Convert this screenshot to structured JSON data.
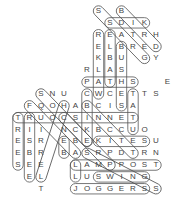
{
  "puzzle": {
    "type": "word-search",
    "origin": {
      "x": 18,
      "y": 11
    },
    "cell_w": 11.5,
    "cell_h": 11.85,
    "letters": [
      {
        "r": 0,
        "c": 7,
        "ch": "S"
      },
      {
        "r": 0,
        "c": 9,
        "ch": "B"
      },
      {
        "r": 1,
        "c": 8,
        "ch": "S"
      },
      {
        "r": 1,
        "c": 9,
        "ch": "D"
      },
      {
        "r": 1,
        "c": 10,
        "ch": "I"
      },
      {
        "r": 1,
        "c": 11,
        "ch": "K"
      },
      {
        "r": 2,
        "c": 7,
        "ch": "R"
      },
      {
        "r": 2,
        "c": 8,
        "ch": "E"
      },
      {
        "r": 2,
        "c": 9,
        "ch": "A"
      },
      {
        "r": 2,
        "c": 10,
        "ch": "T"
      },
      {
        "r": 2,
        "c": 11,
        "ch": "R"
      },
      {
        "r": 2,
        "c": 12,
        "ch": "H"
      },
      {
        "r": 3,
        "c": 7,
        "ch": "E"
      },
      {
        "r": 3,
        "c": 8,
        "ch": "L"
      },
      {
        "r": 3,
        "c": 9,
        "ch": "B"
      },
      {
        "r": 3,
        "c": 10,
        "ch": "R"
      },
      {
        "r": 3,
        "c": 11,
        "ch": "E"
      },
      {
        "r": 3,
        "c": 12,
        "ch": "D"
      },
      {
        "r": 4,
        "c": 7,
        "ch": "K"
      },
      {
        "r": 4,
        "c": 8,
        "ch": "B"
      },
      {
        "r": 4,
        "c": 9,
        "ch": "U"
      },
      {
        "r": 4,
        "c": 11,
        "ch": "G"
      },
      {
        "r": 4,
        "c": 12,
        "ch": "Y"
      },
      {
        "r": 5,
        "c": 6,
        "ch": "R"
      },
      {
        "r": 5,
        "c": 7,
        "ch": "L"
      },
      {
        "r": 5,
        "c": 8,
        "ch": "A"
      },
      {
        "r": 5,
        "c": 9,
        "ch": "S"
      },
      {
        "r": 6,
        "c": 6,
        "ch": "P"
      },
      {
        "r": 6,
        "c": 7,
        "ch": "A"
      },
      {
        "r": 6,
        "c": 8,
        "ch": "T"
      },
      {
        "r": 6,
        "c": 9,
        "ch": "H"
      },
      {
        "r": 6,
        "c": 10,
        "ch": "S"
      },
      {
        "r": 6,
        "c": 13,
        "ch": "E"
      },
      {
        "r": 7,
        "c": 2,
        "ch": "S"
      },
      {
        "r": 7,
        "c": 3,
        "ch": "N"
      },
      {
        "r": 7,
        "c": 4,
        "ch": "U"
      },
      {
        "r": 7,
        "c": 6,
        "ch": "C"
      },
      {
        "r": 7,
        "c": 7,
        "ch": "W"
      },
      {
        "r": 7,
        "c": 8,
        "ch": "C"
      },
      {
        "r": 7,
        "c": 9,
        "ch": "E"
      },
      {
        "r": 7,
        "c": 10,
        "ch": "T"
      },
      {
        "r": 7,
        "c": 11,
        "ch": "T"
      },
      {
        "r": 7,
        "c": 12,
        "ch": "S"
      },
      {
        "r": 8,
        "c": 1,
        "ch": "F"
      },
      {
        "r": 8,
        "c": 2,
        "ch": "Q"
      },
      {
        "r": 8,
        "c": 3,
        "ch": "O"
      },
      {
        "r": 8,
        "c": 4,
        "ch": "H"
      },
      {
        "r": 8,
        "c": 5,
        "ch": "A"
      },
      {
        "r": 8,
        "c": 6,
        "ch": "B"
      },
      {
        "r": 8,
        "c": 7,
        "ch": "C"
      },
      {
        "r": 8,
        "c": 8,
        "ch": "I"
      },
      {
        "r": 8,
        "c": 9,
        "ch": "S"
      },
      {
        "r": 8,
        "c": 10,
        "ch": "A"
      },
      {
        "r": 9,
        "c": 0,
        "ch": "T"
      },
      {
        "r": 9,
        "c": 1,
        "ch": "R"
      },
      {
        "r": 9,
        "c": 2,
        "ch": "U"
      },
      {
        "r": 9,
        "c": 3,
        "ch": "O"
      },
      {
        "r": 9,
        "c": 4,
        "ch": "C"
      },
      {
        "r": 9,
        "c": 5,
        "ch": "S"
      },
      {
        "r": 9,
        "c": 6,
        "ch": "I"
      },
      {
        "r": 9,
        "c": 7,
        "ch": "N"
      },
      {
        "r": 9,
        "c": 8,
        "ch": "N"
      },
      {
        "r": 9,
        "c": 9,
        "ch": "E"
      },
      {
        "r": 9,
        "c": 10,
        "ch": "T"
      },
      {
        "r": 10,
        "c": 0,
        "ch": "R"
      },
      {
        "r": 10,
        "c": 1,
        "ch": "I"
      },
      {
        "r": 10,
        "c": 2,
        "ch": "I"
      },
      {
        "r": 10,
        "c": 4,
        "ch": "N"
      },
      {
        "r": 10,
        "c": 5,
        "ch": "C"
      },
      {
        "r": 10,
        "c": 6,
        "ch": "K"
      },
      {
        "r": 10,
        "c": 7,
        "ch": "B"
      },
      {
        "r": 10,
        "c": 8,
        "ch": "C"
      },
      {
        "r": 10,
        "c": 9,
        "ch": "C"
      },
      {
        "r": 10,
        "c": 10,
        "ch": "U"
      },
      {
        "r": 10,
        "c": 11,
        "ch": "O"
      },
      {
        "r": 11,
        "c": 0,
        "ch": "E"
      },
      {
        "r": 11,
        "c": 1,
        "ch": "S"
      },
      {
        "r": 11,
        "c": 2,
        "ch": "R"
      },
      {
        "r": 11,
        "c": 4,
        "ch": "E"
      },
      {
        "r": 11,
        "c": 5,
        "ch": "B"
      },
      {
        "r": 11,
        "c": 6,
        "ch": "E"
      },
      {
        "r": 11,
        "c": 7,
        "ch": "K"
      },
      {
        "r": 11,
        "c": 8,
        "ch": "I"
      },
      {
        "r": 11,
        "c": 9,
        "ch": "T"
      },
      {
        "r": 11,
        "c": 10,
        "ch": "E"
      },
      {
        "r": 11,
        "c": 11,
        "ch": "S"
      },
      {
        "r": 11,
        "c": 12,
        "ch": "U"
      },
      {
        "r": 12,
        "c": 0,
        "ch": "E"
      },
      {
        "r": 12,
        "c": 1,
        "ch": "B"
      },
      {
        "r": 12,
        "c": 2,
        "ch": "R"
      },
      {
        "r": 12,
        "c": 4,
        "ch": "B"
      },
      {
        "r": 12,
        "c": 5,
        "ch": "A"
      },
      {
        "r": 12,
        "c": 6,
        "ch": "S"
      },
      {
        "r": 12,
        "c": 7,
        "ch": "R"
      },
      {
        "r": 12,
        "c": 8,
        "ch": "P"
      },
      {
        "r": 12,
        "c": 9,
        "ch": "D"
      },
      {
        "r": 12,
        "c": 10,
        "ch": "T"
      },
      {
        "r": 12,
        "c": 11,
        "ch": "R"
      },
      {
        "r": 12,
        "c": 12,
        "ch": "N"
      },
      {
        "r": 13,
        "c": 0,
        "ch": "S"
      },
      {
        "r": 13,
        "c": 1,
        "ch": "E"
      },
      {
        "r": 13,
        "c": 2,
        "ch": "E"
      },
      {
        "r": 13,
        "c": 5,
        "ch": "L"
      },
      {
        "r": 13,
        "c": 6,
        "ch": "A"
      },
      {
        "r": 13,
        "c": 7,
        "ch": "M"
      },
      {
        "r": 13,
        "c": 8,
        "ch": "P"
      },
      {
        "r": 13,
        "c": 9,
        "ch": "P"
      },
      {
        "r": 13,
        "c": 10,
        "ch": "O"
      },
      {
        "r": 13,
        "c": 11,
        "ch": "S"
      },
      {
        "r": 13,
        "c": 12,
        "ch": "T"
      },
      {
        "r": 14,
        "c": 1,
        "ch": "E"
      },
      {
        "r": 14,
        "c": 2,
        "ch": "L"
      },
      {
        "r": 14,
        "c": 5,
        "ch": "L"
      },
      {
        "r": 14,
        "c": 6,
        "ch": "U"
      },
      {
        "r": 14,
        "c": 7,
        "ch": "S"
      },
      {
        "r": 14,
        "c": 8,
        "ch": "W"
      },
      {
        "r": 14,
        "c": 9,
        "ch": "I"
      },
      {
        "r": 14,
        "c": 10,
        "ch": "N"
      },
      {
        "r": 14,
        "c": 11,
        "ch": "G"
      },
      {
        "r": 15,
        "c": 2,
        "ch": "T"
      },
      {
        "r": 15,
        "c": 5,
        "ch": "J"
      },
      {
        "r": 15,
        "c": 6,
        "ch": "O"
      },
      {
        "r": 15,
        "c": 7,
        "ch": "G"
      },
      {
        "r": 15,
        "c": 8,
        "ch": "G"
      },
      {
        "r": 15,
        "c": 9,
        "ch": "E"
      },
      {
        "r": 15,
        "c": 10,
        "ch": "R"
      },
      {
        "r": 15,
        "c": 11,
        "ch": "S"
      },
      {
        "r": 15,
        "c": 12,
        "ch": "S"
      }
    ],
    "found_words": [
      {
        "word": "KIDS",
        "from": [
          1,
          11
        ],
        "to": [
          1,
          8
        ]
      },
      {
        "word": "BIRD",
        "from": [
          0,
          9
        ],
        "to": [
          3,
          12
        ]
      },
      {
        "word": "GRASS",
        "from": [
          4,
          11
        ],
        "to": [
          0,
          7
        ]
      },
      {
        "word": "WALKER",
        "from": [
          7,
          7
        ],
        "to": [
          2,
          7
        ]
      },
      {
        "word": "TABLE",
        "from": [
          6,
          8
        ],
        "to": [
          2,
          8
        ]
      },
      {
        "word": "BUSHES",
        "from": [
          3,
          9
        ],
        "to": [
          8,
          9
        ]
      },
      {
        "word": "PATHS",
        "from": [
          6,
          6
        ],
        "to": [
          6,
          10
        ]
      },
      {
        "word": "CYCLE",
        "from": [
          7,
          6
        ],
        "to": [
          11,
          6
        ]
      },
      {
        "word": "STEP",
        "from": [
          7,
          10
        ],
        "to": [
          10,
          10
        ]
      },
      {
        "word": "SHOES",
        "from": [
          7,
          2
        ],
        "to": [
          11,
          6
        ]
      },
      {
        "word": "FOOT",
        "from": [
          8,
          1
        ],
        "to": [
          12,
          5
        ]
      },
      {
        "word": "TOURIST",
        "from": [
          9,
          0
        ],
        "to": [
          9,
          10
        ]
      },
      {
        "word": "TREES",
        "from": [
          9,
          0
        ],
        "to": [
          13,
          0
        ]
      },
      {
        "word": "BIKES",
        "from": [
          9,
          1
        ],
        "to": [
          14,
          1
        ]
      },
      {
        "word": "HOLE",
        "from": [
          8,
          4
        ],
        "to": [
          14,
          2
        ]
      },
      {
        "word": "CONNECT",
        "from": [
          9,
          4
        ],
        "to": [
          13,
          8
        ]
      },
      {
        "word": "KITES",
        "from": [
          11,
          7
        ],
        "to": [
          11,
          11
        ]
      },
      {
        "word": "BENCH",
        "from": [
          8,
          6
        ],
        "to": [
          12,
          10
        ]
      },
      {
        "word": "BAGS",
        "from": [
          11,
          4
        ],
        "to": [
          12,
          4
        ]
      },
      {
        "word": "SPORT",
        "from": [
          12,
          6
        ],
        "to": [
          15,
          12
        ]
      },
      {
        "word": "LAMPPOST",
        "from": [
          13,
          5
        ],
        "to": [
          13,
          12
        ]
      },
      {
        "word": "SWING",
        "from": [
          14,
          7
        ],
        "to": [
          14,
          11
        ]
      },
      {
        "word": "JOGGERS",
        "from": [
          15,
          5
        ],
        "to": [
          15,
          11
        ]
      },
      {
        "word": "LL",
        "from": [
          13,
          5
        ],
        "to": [
          14,
          5
        ]
      }
    ]
  }
}
